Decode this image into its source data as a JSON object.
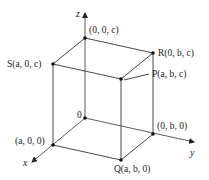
{
  "diagram": {
    "axes": [
      {
        "name": "x",
        "label": "x"
      },
      {
        "name": "y",
        "label": "y"
      },
      {
        "name": "z",
        "label": "z"
      }
    ],
    "origin_label": "0",
    "points": [
      {
        "id": "z-top",
        "label": "(0, 0, c)"
      },
      {
        "id": "S",
        "label": "S(a, 0, c)"
      },
      {
        "id": "R",
        "label": "R(0, b, c)"
      },
      {
        "id": "P",
        "label": "P(a, b, c)"
      },
      {
        "id": "x-pt",
        "label": "(a, 0, 0)"
      },
      {
        "id": "y-pt",
        "label": "(0, b, 0)"
      },
      {
        "id": "Q",
        "label": "Q(a, b, 0)"
      }
    ],
    "colors": {
      "line": "#333333",
      "dot": "#111111",
      "background": "#ffffff"
    }
  }
}
